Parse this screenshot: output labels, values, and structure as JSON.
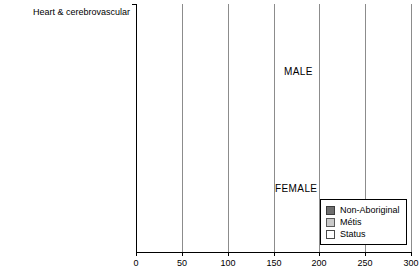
{
  "chart_data": {
    "type": "bar",
    "orientation": "horizontal",
    "title": "",
    "subtitle": "",
    "xlabel": "",
    "ylabel": "",
    "xlim": [
      0,
      300
    ],
    "xticks": [
      0,
      50,
      100,
      150,
      200,
      250,
      300
    ],
    "xticklabels": [
      "0",
      "50",
      "100",
      "150",
      "200",
      "250",
      "300"
    ],
    "grid": true,
    "grid_axis": "x",
    "legend": {
      "position": "bottom-right",
      "entries": [
        {
          "name": "Non-Aboriginal",
          "color": "#6e6e6e"
        },
        {
          "name": "Métis",
          "color": "#c9c9c9"
        },
        {
          "name": "Status",
          "color": "#ffffff"
        }
      ]
    },
    "panels": [
      {
        "label": "MALE",
        "categories": [
          "Heart & cerebrovascular",
          "Cancer",
          "External causes",
          "Respiratory system diseases",
          "Digestive system diseases",
          "Endocrine system diseases",
          "Other causes"
        ],
        "series": [
          {
            "name": "Non-Aboriginal",
            "values": [
              195,
              186,
              64,
              42,
              26,
              18,
              59
            ]
          },
          {
            "name": "Métis",
            "values": [
              248,
              168,
              152,
              54,
              45,
              35,
              94
            ]
          },
          {
            "name": "Status",
            "values": [
              246,
              160,
              190,
              63,
              61,
              51,
              110
            ]
          }
        ]
      },
      {
        "label": "FEMALE",
        "categories": [
          "Heart & cerebrovascular",
          "Cancer",
          "External causes",
          "Respiratory system diseases",
          "Digestive system diseases",
          "Endocrine system diseases",
          "Other causes"
        ],
        "series": [
          {
            "name": "Non-Aboriginal",
            "values": [
              94,
              133,
              18,
              19,
              11,
              10,
              31
            ]
          },
          {
            "name": "Métis",
            "values": [
              161,
              179,
              34,
              39,
              33,
              26,
              71
            ]
          },
          {
            "name": "Status",
            "values": [
              164,
              155,
              67,
              51,
              50,
              49,
              84
            ]
          }
        ]
      }
    ]
  }
}
